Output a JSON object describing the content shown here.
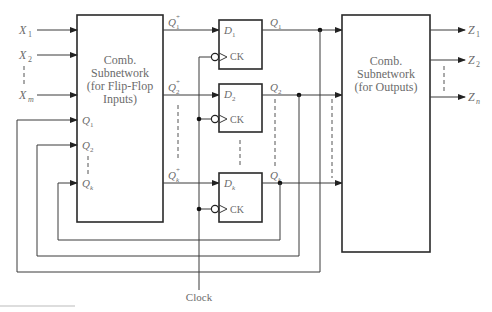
{
  "diagram": {
    "type": "sequential-circuit-block-diagram",
    "inputs": [
      {
        "name": "X",
        "sub": "1"
      },
      {
        "name": "X",
        "sub": "2"
      },
      {
        "name": "X",
        "sub": "m"
      }
    ],
    "state_inputs": [
      {
        "name": "Q",
        "sub": "1"
      },
      {
        "name": "Q",
        "sub": "2"
      },
      {
        "name": "Q",
        "sub": "k"
      }
    ],
    "next_state": [
      {
        "name": "Q",
        "sub": "1",
        "sup": "+"
      },
      {
        "name": "Q",
        "sub": "2",
        "sup": "+"
      },
      {
        "name": "Q",
        "sub": "k",
        "sup": "+"
      }
    ],
    "flip_flops": [
      {
        "d_name": "D",
        "d_sub": "1",
        "clk": "CK",
        "q_name": "Q",
        "q_sub": "1"
      },
      {
        "d_name": "D",
        "d_sub": "2",
        "clk": "CK",
        "q_name": "Q",
        "q_sub": "2"
      },
      {
        "d_name": "D",
        "d_sub": "k",
        "clk": "CK",
        "q_name": "Q",
        "q_sub": "k"
      }
    ],
    "left_block": {
      "lines": [
        "Comb.",
        "Subnetwork",
        "(for Flip-Flop",
        "Inputs)"
      ]
    },
    "right_block": {
      "lines": [
        "Comb.",
        "Subnetwork",
        "(for Outputs)"
      ]
    },
    "outputs": [
      {
        "name": "Z",
        "sub": "1"
      },
      {
        "name": "Z",
        "sub": "2"
      },
      {
        "name": "Z",
        "sub": "n"
      }
    ],
    "clock_label": "Clock"
  }
}
